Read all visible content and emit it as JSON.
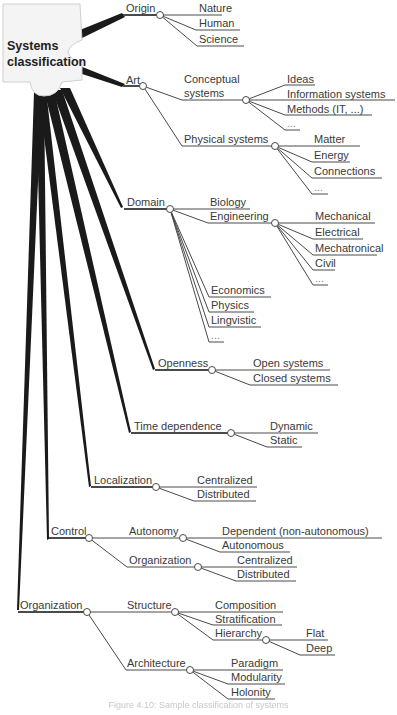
{
  "root": {
    "line1": "Systems",
    "line2": "classification"
  },
  "tree": {
    "origin": {
      "label": "Origin",
      "children": [
        "Nature",
        "Human",
        "Science"
      ]
    },
    "art": {
      "label": "Art",
      "conceptual": {
        "line1": "Conceptual",
        "line2": "systems",
        "children": [
          "Ideas",
          "Information systems",
          "Methods (IT, ...)",
          "..."
        ]
      },
      "physical": {
        "label": "Physical systems",
        "children": [
          "Matter",
          "Energy",
          "Connections",
          "..."
        ]
      }
    },
    "domain": {
      "label": "Domain",
      "biology": "Biology",
      "engineering": {
        "label": "Engineering",
        "children": [
          "Mechanical",
          "Electrical",
          "Mechatronical",
          "Civil",
          "..."
        ]
      },
      "others": [
        "Economics",
        "Physics",
        "Lingvistic",
        "..."
      ]
    },
    "openness": {
      "label": "Openness",
      "children": [
        "Open systems",
        "Closed systems"
      ]
    },
    "time": {
      "label": "Time dependence",
      "children": [
        "Dynamic",
        "Static"
      ]
    },
    "localization": {
      "label": "Localization",
      "children": [
        "Centralized",
        "Distributed"
      ]
    },
    "control": {
      "label": "Control",
      "autonomy": {
        "label": "Autonomy",
        "children": [
          "Dependent (non-autonomous)",
          "Autonomous"
        ]
      },
      "organization": {
        "label": "Organization",
        "children": [
          "Centralized",
          "Distributed"
        ]
      }
    },
    "organization": {
      "label": "Organization",
      "structure": {
        "label": "Structure",
        "children": [
          "Composition",
          "Stratification"
        ],
        "hierarchy": {
          "label": "Hierarchy",
          "children": [
            "Flat",
            "Deep"
          ]
        }
      },
      "architecture": {
        "label": "Architecture",
        "children": [
          "Paradigm",
          "Modularity",
          "Holonity"
        ]
      }
    }
  },
  "caption": "Figure 4.10: Sample classification of systems",
  "colors": {
    "line": "#4a4a4a",
    "trunk": "#1a1a1a",
    "node_fill": "#ffffff",
    "text": "#3a3a3a"
  }
}
